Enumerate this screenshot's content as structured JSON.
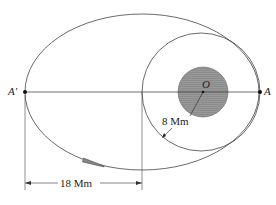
{
  "diagram": {
    "points": {
      "A_prime": "A'",
      "A": "A",
      "O": "O"
    },
    "dimensions": {
      "radius_label": "8 Mm",
      "distance_label": "18 Mm"
    },
    "colors": {
      "line": "#333333",
      "planet": "#8a8a8a",
      "rocket": "#777777"
    }
  }
}
